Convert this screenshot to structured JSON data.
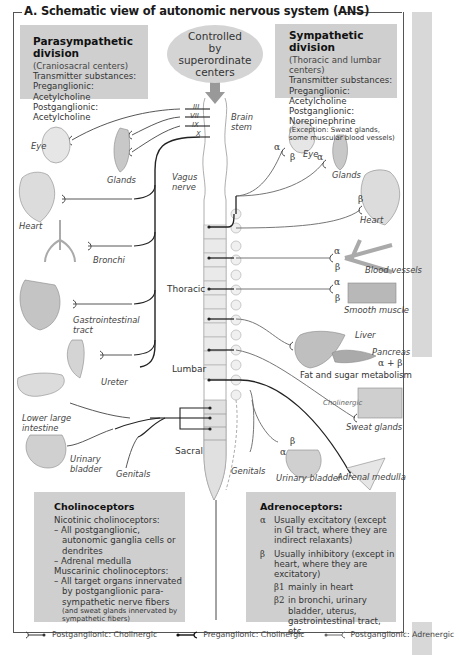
{
  "title": "A. Schematic view of autonomic nervous system (ANS)",
  "controlled": "Controlled by superordinate centers",
  "controlled_lines": [
    "Controlled",
    "by",
    "superordinate",
    "centers"
  ],
  "parasympathetic": {
    "heading": "Parasympathetic division",
    "subtitle": "(Craniosacral centers)",
    "transmitters_label": "Transmitter substances:",
    "preganglionic": "Preganglionic: Acetylcholine",
    "postganglionic": "Postganglionic: Acetylcholine"
  },
  "sympathetic": {
    "heading": "Sympathetic division",
    "subtitle": "(Thoracic and lumbar centers)",
    "transmitters_label": "Transmitter substances:",
    "preganglionic": "Preganglionic: Acetylcholine",
    "postganglionic": "Postganglionic: Norepinephrine",
    "exception_line1": "(Exception: Sweat glands,",
    "exception_line2": "some muscular blood vessels)"
  },
  "spinal_labels": {
    "brain_stem_1": "Brain",
    "brain_stem_2": "stem",
    "thoracic": "Thoracic",
    "lumbar": "Lumbar",
    "sacral": "Sacral",
    "vagus_1": "Vagus",
    "vagus_2": "nerve",
    "cranial_nerves": [
      "III",
      "VII",
      "IX",
      "X"
    ]
  },
  "parasympathetic_targets": [
    {
      "label": "Eye"
    },
    {
      "label": "Glands"
    },
    {
      "label": "Heart"
    },
    {
      "label": "Bronchi"
    },
    {
      "label": "Gastrointestinal",
      "label2": "tract"
    },
    {
      "label": "Ureter"
    },
    {
      "label": "Lower large",
      "label2": "intestine"
    },
    {
      "label": "Urinary",
      "label2": "bladder"
    },
    {
      "label": "Genitals"
    }
  ],
  "sympathetic_targets": [
    {
      "label": "Eye",
      "receptors": "α β"
    },
    {
      "label": "Glands",
      "receptors": "α"
    },
    {
      "label": "Heart",
      "receptors": "β"
    },
    {
      "label": "Blood vessels",
      "receptors": "α β"
    },
    {
      "label": "Smooth muscle",
      "receptors": "α β"
    },
    {
      "label": "Liver"
    },
    {
      "label": "Pancreas",
      "receptors": "α + β"
    },
    {
      "label": "Fat and sugar metabolism"
    },
    {
      "label": "Sweat glands",
      "note": "Cholinergic"
    },
    {
      "label": "Genitals"
    },
    {
      "label": "Urinary bladder",
      "receptors": "α β"
    },
    {
      "label": "Adrenal medulla"
    }
  ],
  "receptors": {
    "alpha": "α",
    "beta": "β",
    "alpha_plus_beta": "α + β"
  },
  "cholinoceptors": {
    "heading": "Cholinoceptors",
    "nicotinic_label": "Nicotinic cholinoceptors:",
    "nicotinic_items": [
      "– All postganglionic, autonomic ganglia cells or dendrites",
      "– Adrenal medulla"
    ],
    "muscarinic_label": "Muscarinic cholinoceptors:",
    "muscarinic_items": [
      "– All target organs innervated by postganglionic para-sympathetic nerve fibers"
    ],
    "muscarinic_note": "(and sweat glands innervated by sympathetic fibers)"
  },
  "adrenoceptors": {
    "heading": "Adrenoceptors:",
    "alpha_symbol": "α",
    "alpha_text": "Usually excitatory (except in GI tract, where they are indirect relaxants)",
    "beta_symbol": "β",
    "beta_text": "Usually inhibitory (except in heart, where they are excitatory)",
    "beta1_symbol": "β1",
    "beta1_text": "mainly in heart",
    "beta2_symbol": "β2",
    "beta2_text": "in bronchi, urinary bladder, uterus, gastrointestinal tract, etc."
  },
  "legend": [
    {
      "label": "Postganglionic: Cholinergic"
    },
    {
      "label": "Preganglionic: Cholinergic"
    },
    {
      "label": "Postganglionic: Adrenergic"
    }
  ],
  "colors": {
    "box_bg": "#cfcfcf",
    "line_dark": "#222222",
    "line_gray": "#666666",
    "frame": "#555555"
  }
}
